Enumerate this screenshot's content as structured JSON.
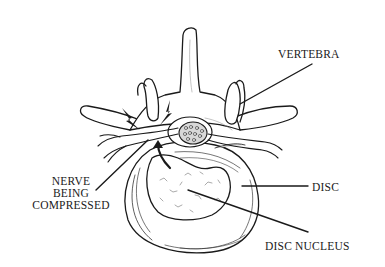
{
  "diagram": {
    "labels": {
      "vertebra": "VERTEBRA",
      "nerve_line1": "NERVE",
      "nerve_line2": "BEING",
      "nerve_line3": "COMPRESSED",
      "disc": "DISC",
      "disc_nucleus": "DISC NUCLEUS"
    },
    "colors": {
      "ink": "#1a1a1a",
      "background": "#ffffff",
      "shade": "#d8d8d8"
    }
  }
}
